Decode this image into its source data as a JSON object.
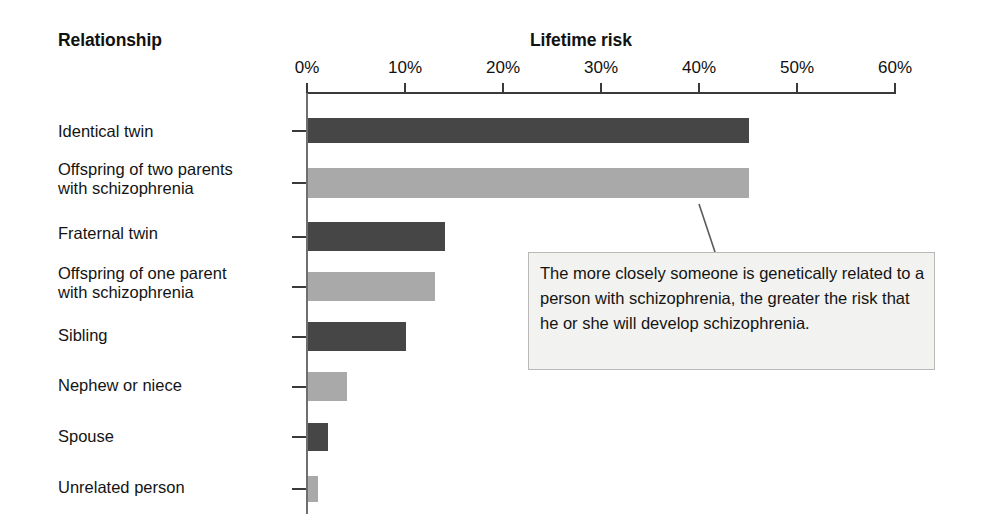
{
  "headers": {
    "relationship": "Relationship",
    "lifetime_risk": "Lifetime risk"
  },
  "callout": {
    "text": "The more closely someone is genetically related to a person with schizophrenia, the greater the risk that he or she will develop schizophrenia."
  },
  "colors": {
    "bar_dark": "#464646",
    "bar_light": "#a9a9a9",
    "axis": "#3a3a3a",
    "callout_bg": "#f2f2f0",
    "callout_border": "#b9b9b7",
    "text": "#141414"
  },
  "chart_data": {
    "type": "bar",
    "orientation": "horizontal",
    "title": "Lifetime risk",
    "xlabel": "Lifetime risk",
    "ylabel": "Relationship",
    "xlim": [
      0,
      60
    ],
    "grid": false,
    "legend": "none",
    "xticks": [
      0,
      10,
      20,
      30,
      40,
      50,
      60
    ],
    "xtick_labels": [
      "0%",
      "10%",
      "20%",
      "30%",
      "40%",
      "50%",
      "60%"
    ],
    "categories": [
      "Identical twin",
      "Offspring of two parents\nwith schizophrenia",
      "Fraternal twin",
      "Offspring of one parent\nwith schizophrenia",
      "Sibling",
      "Nephew or niece",
      "Spouse",
      "Unrelated person"
    ],
    "values": [
      45,
      45,
      14,
      13,
      10,
      4,
      2,
      1
    ],
    "bar_colors": [
      "#464646",
      "#a9a9a9",
      "#464646",
      "#a9a9a9",
      "#464646",
      "#a9a9a9",
      "#464646",
      "#a9a9a9"
    ],
    "annotations": [
      {
        "text": "The more closely someone is genetically related to a person with schizophrenia, the greater the risk that he or she will develop schizophrenia.",
        "points_to": "Offspring of two parents with schizophrenia"
      }
    ]
  },
  "_layout": {
    "x0_px": 307,
    "px_per_percent": 9.8,
    "rows": [
      {
        "label_top": 122,
        "bar_top": 118,
        "bar_height": 25,
        "tick_top": 130
      },
      {
        "label_top": 160,
        "bar_top": 168,
        "bar_height": 30,
        "tick_top": 182
      },
      {
        "label_top": 224,
        "bar_top": 222,
        "bar_height": 29,
        "tick_top": 236
      },
      {
        "label_top": 264,
        "bar_top": 272,
        "bar_height": 29,
        "tick_top": 286
      },
      {
        "label_top": 326,
        "bar_top": 322,
        "bar_height": 29,
        "tick_top": 336
      },
      {
        "label_top": 376,
        "bar_top": 372,
        "bar_height": 29,
        "tick_top": 386
      },
      {
        "label_top": 427,
        "bar_top": 423,
        "bar_height": 28,
        "tick_top": 436
      },
      {
        "label_top": 478,
        "bar_top": 476,
        "bar_height": 26,
        "tick_top": 488
      }
    ]
  }
}
